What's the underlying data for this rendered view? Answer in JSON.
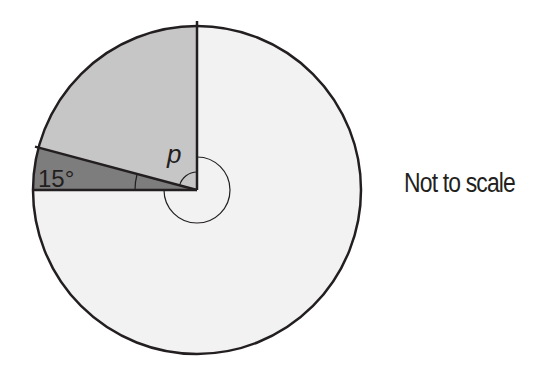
{
  "diagram": {
    "type": "circle-sectors",
    "note": "Not to scale",
    "labels": {
      "small_angle": "15°",
      "unknown_angle": "p"
    },
    "colors": {
      "outline": "#231f20",
      "large_sector": "#f2f2f2",
      "medium_sector": "#c6c6c6",
      "small_sector": "#7d7d7d"
    },
    "sectors": [
      {
        "name": "small-sector",
        "angle_label": "15°",
        "shade": "dark"
      },
      {
        "name": "medium-sector",
        "angle_label": "p",
        "shade": "medium"
      },
      {
        "name": "large-sector",
        "angle_label": "reflex",
        "shade": "light"
      }
    ]
  }
}
